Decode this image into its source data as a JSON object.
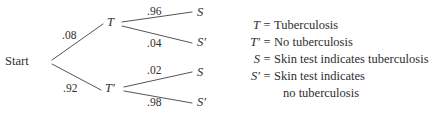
{
  "diagram": {
    "type": "probability-tree",
    "root": {
      "label": "Start"
    },
    "level1": [
      {
        "label": "T",
        "probability": ".08"
      },
      {
        "label": "T′",
        "probability": ".92"
      }
    ],
    "level2": [
      {
        "label": "S",
        "probability": ".96",
        "parent": "T"
      },
      {
        "label": "S′",
        "probability": ".04",
        "parent": "T"
      },
      {
        "label": "S",
        "probability": ".02",
        "parent": "T′"
      },
      {
        "label": "S′",
        "probability": ".98",
        "parent": "T′"
      }
    ],
    "line_color": "#555555"
  },
  "legend": {
    "rows": [
      {
        "symbol": "T",
        "equals": "=",
        "definition": "Tuberculosis"
      },
      {
        "symbol": "T′",
        "equals": "=",
        "definition": "No tuberculosis"
      },
      {
        "symbol": "S",
        "equals": "=",
        "definition": "Skin test indicates tuberculosis"
      },
      {
        "symbol": "S′",
        "equals": "=",
        "definition": "Skin test indicates"
      }
    ],
    "continuation": "no tuberculosis"
  }
}
